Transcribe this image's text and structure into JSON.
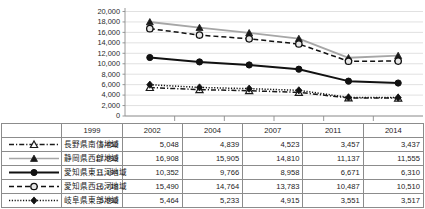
{
  "chart_data": {
    "type": "line",
    "title": "",
    "xlabel": "",
    "ylabel": "",
    "categories": [
      "1999",
      "2002",
      "2004",
      "2007",
      "2011",
      "2014"
    ],
    "ylim": [
      0,
      20000
    ],
    "ytick_step": 2000,
    "yticks": [
      "20,000",
      "18,000",
      "16,000",
      "14,000",
      "12,000",
      "10,000",
      "8,000",
      "6,000",
      "4,000",
      "2,000",
      "0"
    ],
    "grid": true,
    "legend_position": "left-table-column",
    "series": [
      {
        "name": "長野県南信地域",
        "marker": "open-triangle",
        "line_style": "dash-dot",
        "color": "#1a1a1a",
        "values": [
          5450,
          5048,
          4839,
          4523,
          3457,
          3437
        ],
        "labels": [
          "5,450",
          "5,048",
          "4,839",
          "4,523",
          "3,457",
          "3,437"
        ]
      },
      {
        "name": "静岡県西部地域",
        "marker": "filled-triangle",
        "line_style": "solid",
        "color": "#a6a6a6",
        "values": [
          17999,
          16908,
          15905,
          14810,
          11137,
          11555
        ],
        "labels": [
          "17,999",
          "16,908",
          "15,905",
          "14,810",
          "11,137",
          "11,555"
        ]
      },
      {
        "name": "愛知県東三河地域",
        "marker": "filled-circle",
        "line_style": "solid",
        "color": "#111111",
        "values": [
          11194,
          10352,
          9766,
          8958,
          6671,
          6310
        ],
        "labels": [
          "11,194",
          "10,352",
          "9,766",
          "8,958",
          "6,671",
          "6,310"
        ]
      },
      {
        "name": "愛知県西三河地域",
        "marker": "open-circle",
        "line_style": "dashed",
        "color": "#111111",
        "values": [
          16718,
          15490,
          14764,
          13783,
          10487,
          10510
        ],
        "labels": [
          "16,718",
          "15,490",
          "14,764",
          "13,783",
          "10,487",
          "10,510"
        ]
      },
      {
        "name": "岐阜県東部地域",
        "marker": "filled-diamond",
        "line_style": "dotted",
        "color": "#111111",
        "values": [
          5990,
          5464,
          5233,
          4915,
          3551,
          3517
        ],
        "labels": [
          "5,990",
          "5,464",
          "5,233",
          "4,915",
          "3,551",
          "3,517"
        ]
      }
    ]
  },
  "colors": {
    "gridline": "#d9d9d9",
    "axis": "#8c8c8c",
    "table_border": "#8c8c8c",
    "gray_series": "#a6a6a6",
    "black_series": "#111111",
    "text": "#1b1b1b"
  }
}
